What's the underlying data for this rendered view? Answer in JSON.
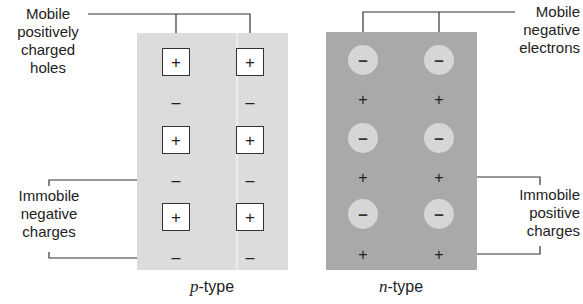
{
  "diagram": {
    "colors": {
      "p_panel": "#dcdcdc",
      "n_panel": "#a9a9a9",
      "hole_fill": "#ffffff",
      "electron_fill": "#d6d6d6",
      "leader_line": "#333333"
    },
    "p_type": {
      "caption_italic": "p",
      "caption_rest": "-type",
      "mobile_symbol": "+",
      "fixed_symbol": "–",
      "label_mobile": [
        "Mobile",
        "positively",
        "charged",
        "holes"
      ],
      "label_immobile": [
        "Immobile",
        "negative",
        "charges"
      ]
    },
    "n_type": {
      "caption_italic": "n",
      "caption_rest": "-type",
      "mobile_symbol": "–",
      "fixed_symbol": "+",
      "label_mobile": [
        "Mobile",
        "negative",
        "electrons"
      ],
      "label_immobile": [
        "Immobile",
        "positive",
        "charges"
      ]
    }
  }
}
